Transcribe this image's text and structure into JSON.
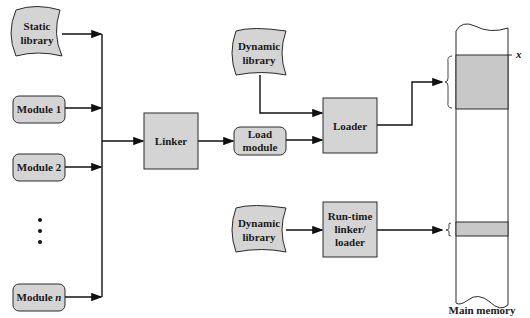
{
  "diagram": {
    "nodes": {
      "static_library": {
        "lines": [
          "Static",
          "library"
        ]
      },
      "module_1": {
        "label": "Module 1"
      },
      "module_2": {
        "label": "Module 2"
      },
      "ellipsis": {
        "label": "⋮"
      },
      "module_n": {
        "prefix": "Module ",
        "italic": "n"
      },
      "linker": {
        "label": "Linker"
      },
      "load_module": {
        "lines": [
          "Load",
          "module"
        ]
      },
      "dynamic_library_top": {
        "lines": [
          "Dynamic",
          "library"
        ]
      },
      "loader": {
        "label": "Loader"
      },
      "dynamic_library_bottom": {
        "lines": [
          "Dynamic",
          "library"
        ]
      },
      "runtime_linker_loader": {
        "lines": [
          "Run-time",
          "linker/",
          "loader"
        ]
      },
      "main_memory": {
        "label": "Main memory",
        "address_marker": "x"
      }
    },
    "edges": [
      {
        "from": "static_library",
        "to": "linker"
      },
      {
        "from": "module_1",
        "to": "linker"
      },
      {
        "from": "module_2",
        "to": "linker"
      },
      {
        "from": "module_n",
        "to": "linker"
      },
      {
        "from": "linker",
        "to": "load_module"
      },
      {
        "from": "load_module",
        "to": "loader"
      },
      {
        "from": "dynamic_library_top",
        "to": "loader"
      },
      {
        "from": "loader",
        "to": "main_memory"
      },
      {
        "from": "dynamic_library_bottom",
        "to": "runtime_linker_loader"
      },
      {
        "from": "runtime_linker_loader",
        "to": "main_memory"
      }
    ],
    "colors": {
      "fill": "#d4d4d4",
      "stroke": "#2a2a2a",
      "memory_block": "#c8c8c8"
    }
  }
}
